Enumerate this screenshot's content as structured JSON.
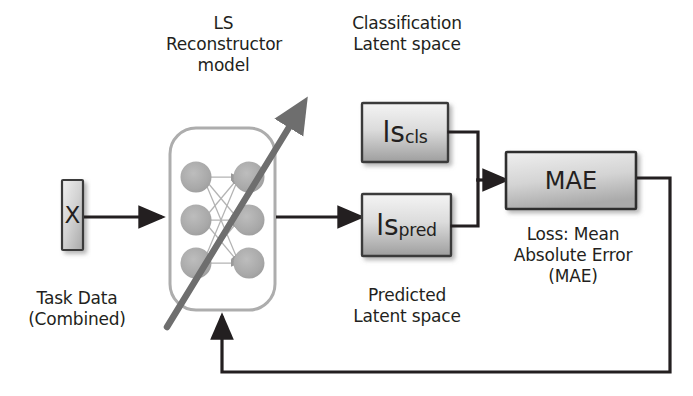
{
  "diagram": {
    "title_visible": false,
    "labels": {
      "model_caption": "LS\nReconstructor\nmodel",
      "cls_latent_caption": "Classification\nLatent space",
      "pred_latent_caption": "Predicted\nLatent space",
      "input_caption": "Task Data\n(Combined)",
      "loss_caption": "Loss: Mean\nAbsolute Error\n(MAE)"
    },
    "nodes": {
      "input_box": {
        "label": "X"
      },
      "nn_box": {
        "label": "",
        "input_units": 3,
        "output_units": 3
      },
      "ls_cls_box": {
        "base": "ls",
        "subscript": "cls"
      },
      "ls_pred_box": {
        "base": "ls",
        "subscript": "pred"
      },
      "mae_box": {
        "label": "MAE"
      }
    },
    "edges": [
      {
        "name": "input-to-model",
        "from": "input_box",
        "to": "nn_box",
        "style": "arrow"
      },
      {
        "name": "model-to-ls-pred",
        "from": "nn_box",
        "to": "ls_pred_box",
        "style": "arrow"
      },
      {
        "name": "ls-cls-to-mae",
        "from": "ls_cls_box",
        "to": "mae_box",
        "style": "arrow"
      },
      {
        "name": "ls-pred-to-mae",
        "from": "ls_pred_box",
        "to": "mae_box",
        "style": "arrow"
      },
      {
        "name": "mae-feedback-to-model",
        "from": "mae_box",
        "to": "nn_box",
        "style": "arrow"
      }
    ],
    "annotations": {
      "diagonal_arrow": "training-direction-arrow"
    },
    "colors": {
      "ink": "#231f20",
      "box_fill_light": "#f2f2f2",
      "box_fill_dark": "#a6a6a6",
      "node_fill": "#a9a9a9",
      "nn_outline": "#a6a6a6",
      "diagonal": "#6e6e6e",
      "connector": "#231f20",
      "background": "#ffffff"
    }
  }
}
